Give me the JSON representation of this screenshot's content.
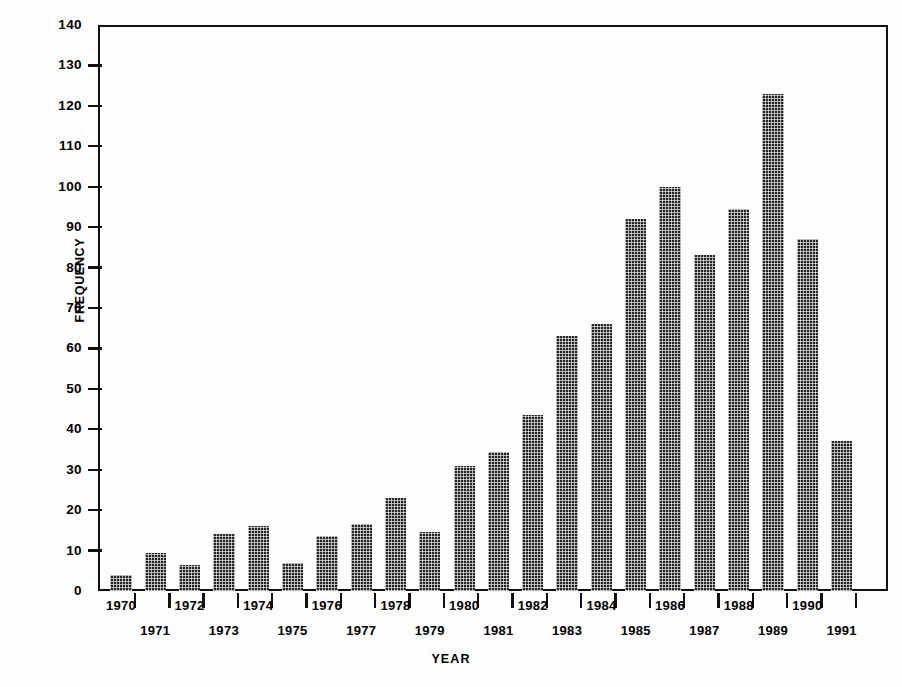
{
  "chart_data": {
    "type": "bar",
    "title": "",
    "xlabel": "YEAR",
    "ylabel": "FREQUENCY",
    "categories": [
      "1970",
      "1971",
      "1972",
      "1973",
      "1974",
      "1975",
      "1976",
      "1977",
      "1978",
      "1979",
      "1980",
      "1981",
      "1982",
      "1983",
      "1984",
      "1985",
      "1986",
      "1987",
      "1988",
      "1989",
      "1990",
      "1991"
    ],
    "values": [
      4,
      9.5,
      6.5,
      14,
      16,
      7,
      13.5,
      16.5,
      23,
      14.5,
      31,
      34.5,
      43.5,
      63,
      66,
      92,
      100,
      83,
      94.5,
      123,
      87,
      37
    ],
    "ylim": [
      0,
      140
    ],
    "ytick_step": 10,
    "ytick_labels": [
      "0",
      "10",
      "20",
      "30",
      "40",
      "50",
      "60",
      "70",
      "80",
      "90",
      "100",
      "110",
      "120",
      "130",
      "140"
    ],
    "grid": false,
    "legend": null,
    "series": [
      {
        "name": "Frequency",
        "values": [
          4,
          9.5,
          6.5,
          14,
          16,
          7,
          13.5,
          16.5,
          23,
          14.5,
          31,
          34.5,
          43.5,
          63,
          66,
          92,
          100,
          83,
          94.5,
          123,
          87,
          37
        ]
      }
    ],
    "bar_color": "#242424",
    "bar_fill_pattern": "halftone-checkerboard",
    "axis_color": "#111111",
    "background_color": "#ffffff",
    "xtick_label_layout": "staggered-two-rows"
  },
  "axes": {
    "y_title": "FREQUENCY",
    "x_title": "YEAR"
  }
}
